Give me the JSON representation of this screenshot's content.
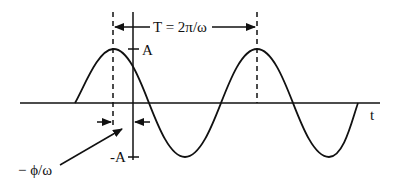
{
  "diagram": {
    "period_label": "T = 2π/ω",
    "amplitude_label": "A",
    "neg_amplitude_label": "-A",
    "time_axis_label": "t",
    "phase_label": "− ϕ/ω",
    "colors": {
      "stroke": "#111111",
      "background": "#ffffff"
    }
  }
}
